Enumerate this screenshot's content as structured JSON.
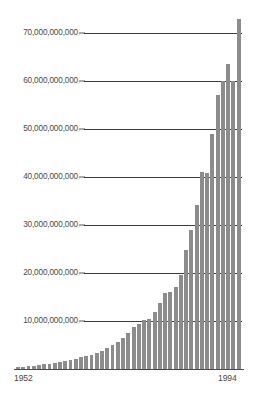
{
  "chart_data": {
    "type": "bar",
    "title": "",
    "subtitle": "",
    "xlabel": "",
    "ylabel": "",
    "grid": true,
    "legend": "none",
    "bar_color": "#8c8c8c",
    "gridline_color": "#3d3d3d",
    "axis_color": "#4a4a4a",
    "ylim": [
      0,
      77000000000
    ],
    "xlim_labels": [
      "1952",
      "1994"
    ],
    "y_ticks": [
      {
        "value": 70000000000,
        "label": "70,000,000,000"
      },
      {
        "value": 60000000000,
        "label": "60,000,000,000"
      },
      {
        "value": 50000000000,
        "label": "50,000,000,000"
      },
      {
        "value": 40000000000,
        "label": "40,000,000,000"
      },
      {
        "value": 30000000000,
        "label": "30,000,000,000"
      },
      {
        "value": 20000000000,
        "label": "20,000,000,000"
      },
      {
        "value": 10000000000,
        "label": "10,000,000,000"
      }
    ],
    "x_ticks": [
      {
        "value": 1952,
        "label": "1952"
      },
      {
        "value": 1994,
        "label": "1994"
      }
    ],
    "categories": [
      "1952",
      "1953",
      "1954",
      "1955",
      "1956",
      "1957",
      "1958",
      "1959",
      "1960",
      "1961",
      "1962",
      "1963",
      "1964",
      "1965",
      "1966",
      "1967",
      "1968",
      "1969",
      "1970",
      "1971",
      "1972",
      "1973",
      "1974",
      "1975",
      "1976",
      "1977",
      "1978",
      "1979",
      "1980",
      "1981",
      "1982",
      "1983",
      "1984",
      "1985",
      "1986",
      "1987",
      "1988",
      "1989",
      "1990",
      "1991",
      "1992",
      "1993",
      "1994"
    ],
    "values": [
      400000000,
      500000000,
      600000000,
      700000000,
      900000000,
      1000000000,
      1100000000,
      1300000000,
      1500000000,
      1700000000,
      1900000000,
      2100000000,
      2400000000,
      2700000000,
      3000000000,
      3400000000,
      3800000000,
      4300000000,
      4900000000,
      5600000000,
      6500000000,
      7500000000,
      8700000000,
      9400000000,
      10200000000,
      10400000000,
      11800000000,
      13700000000,
      15900000000,
      16000000000,
      17000000000,
      19500000000,
      24800000000,
      29000000000,
      34200000000,
      41000000000,
      40800000000,
      49000000000,
      57000000000,
      60000000000,
      63500000000,
      60000000000,
      73000000000
    ]
  }
}
